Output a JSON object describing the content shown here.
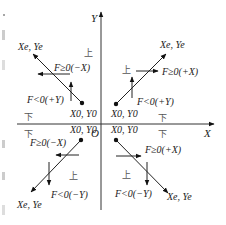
{
  "axes": {
    "x_label": "X",
    "y_label": "Y",
    "origin_label": "O"
  },
  "quadrants": [
    {
      "id": "q1",
      "start_label": "X0, Y0",
      "end_label": "Xe, Ye",
      "up_label": "上",
      "down_label": "下",
      "f_ge_label": "F≥0(+X)",
      "f_lt_label": "F<0(+Y)"
    },
    {
      "id": "q2",
      "start_label": "X0, Y0",
      "end_label": "Xe, Ye",
      "up_label": "上",
      "down_label": "下",
      "f_ge_label": "F≥0(−X)",
      "f_lt_label": "F<0(+Y)"
    },
    {
      "id": "q3",
      "start_label": "X0, Y0",
      "end_label": "Xe, Ye",
      "up_label": "上",
      "down_label": "下",
      "f_ge_label": "F≥0(−X)",
      "f_lt_label": "F<0(−Y)"
    },
    {
      "id": "q4",
      "start_label": "X0, Y0",
      "end_label": "Xe, Ye",
      "up_label": "上",
      "down_label": "下",
      "f_ge_label": "F≥0(+X)",
      "f_lt_label": "F<0(−Y)"
    }
  ]
}
